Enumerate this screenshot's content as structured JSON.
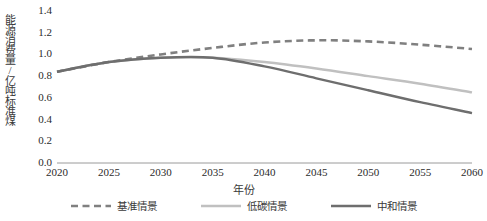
{
  "chart_data": {
    "type": "line",
    "title": "",
    "xlabel": "年份",
    "ylabel": "能源消费量/亿吨标准煤",
    "x": [
      2020,
      2025,
      2030,
      2035,
      2040,
      2045,
      2050,
      2055,
      2060
    ],
    "xlim": [
      2020,
      2060
    ],
    "ylim": [
      0.0,
      1.4
    ],
    "yticks": [
      "1.4",
      "1.2",
      "1.0",
      "0.8",
      "0.6",
      "0.4",
      "0.2",
      "0.0"
    ],
    "ytick_values": [
      1.4,
      1.2,
      1.0,
      0.8,
      0.6,
      0.4,
      0.2,
      0.0
    ],
    "xticks": [
      "2020",
      "2025",
      "2030",
      "2035",
      "2040",
      "2045",
      "2050",
      "2055",
      "2060"
    ],
    "grid": false,
    "legend_position": "bottom",
    "series": [
      {
        "name": "基准情景",
        "style": "dashed",
        "color": "#808080",
        "values": [
          0.84,
          0.93,
          1.0,
          1.06,
          1.11,
          1.13,
          1.12,
          1.09,
          1.05
        ]
      },
      {
        "name": "低碳情景",
        "style": "solid",
        "color": "#c0c0c0",
        "values": [
          0.84,
          0.93,
          0.97,
          0.97,
          0.93,
          0.87,
          0.8,
          0.73,
          0.65
        ]
      },
      {
        "name": "中和情景",
        "style": "solid",
        "color": "#6e6e6e",
        "values": [
          0.84,
          0.93,
          0.97,
          0.97,
          0.89,
          0.78,
          0.67,
          0.56,
          0.46
        ]
      }
    ]
  },
  "axes": {
    "y_title": "能源消费量/亿吨标准煤",
    "x_title": "年份"
  },
  "legend": {
    "items": [
      {
        "label": "基准情景",
        "color": "#808080",
        "style": "dashed"
      },
      {
        "label": "低碳情景",
        "color": "#c0c0c0",
        "style": "solid"
      },
      {
        "label": "中和情景",
        "color": "#6e6e6e",
        "style": "solid"
      }
    ]
  },
  "colors": {
    "baseline": "#808080",
    "lowcarbon": "#c0c0c0",
    "neutral": "#6e6e6e",
    "axis": "#9a9a9a",
    "text": "#2b2b2b"
  }
}
